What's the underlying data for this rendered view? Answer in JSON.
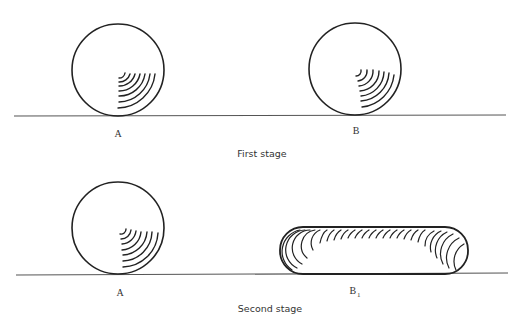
{
  "figure": {
    "stages": [
      {
        "caption": "First stage",
        "objects": [
          {
            "label": "A",
            "shape": "circle",
            "description": "ball with curved strain lines in lower-right quadrant"
          },
          {
            "label": "B",
            "shape": "circle",
            "description": "ball with curved strain lines in lower-right quadrant"
          }
        ]
      },
      {
        "caption": "Second stage",
        "objects": [
          {
            "label": "A",
            "shape": "circle",
            "description": "ball with curved strain lines in lower-right quadrant"
          },
          {
            "label": "B",
            "label_subscript": "1",
            "shape": "capsule",
            "description": "flattened elongated body with strain lines along top and ends"
          }
        ]
      }
    ],
    "colors": {
      "line": "#222222",
      "ground": "#555555",
      "text": "#333333",
      "background": "#ffffff"
    }
  }
}
